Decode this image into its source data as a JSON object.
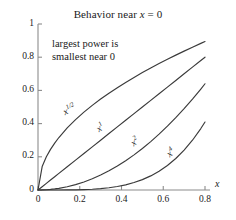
{
  "chart_data": {
    "type": "line",
    "title": "Behavior near x = 0",
    "title_prefix": "Behavior near ",
    "title_var": "x",
    "title_suffix": " = 0",
    "xlabel": "x",
    "ylabel": "",
    "xlim": [
      0,
      0.8
    ],
    "ylim": [
      0,
      1
    ],
    "grid": false,
    "legend": "none",
    "xticks": [
      "0",
      "0.2",
      "0.4",
      "0.6",
      "0.8"
    ],
    "xtick_values": [
      0,
      0.2,
      0.4,
      0.6,
      0.8
    ],
    "yticks": [
      "0",
      "0.2",
      "0.4",
      "0.6",
      "0.8",
      "1"
    ],
    "ytick_values": [
      0,
      0.2,
      0.4,
      0.6,
      0.8,
      1
    ],
    "annotations": [
      {
        "name": "largest-power-note",
        "line1": "largest power is",
        "line2": "smallest near 0"
      }
    ],
    "x": [
      0,
      0.02,
      0.04,
      0.06,
      0.08,
      0.1,
      0.14,
      0.18,
      0.22,
      0.26,
      0.3,
      0.34,
      0.38,
      0.42,
      0.46,
      0.5,
      0.54,
      0.58,
      0.62,
      0.66,
      0.7,
      0.74,
      0.78,
      0.8
    ],
    "series": [
      {
        "name": "x^(1/2)",
        "base": "x",
        "exponent": "1/2",
        "color": "#3a3a3a",
        "label_x": 0.135,
        "label_y": 0.44,
        "label_rotation": -27,
        "values": [
          0,
          0.1414,
          0.2,
          0.2449,
          0.2828,
          0.3162,
          0.3742,
          0.4243,
          0.469,
          0.5099,
          0.5477,
          0.5831,
          0.6164,
          0.6481,
          0.6782,
          0.7071,
          0.7348,
          0.7616,
          0.7874,
          0.8124,
          0.8367,
          0.8602,
          0.8832,
          0.8944
        ]
      },
      {
        "name": "x^1",
        "base": "x",
        "exponent": "1",
        "color": "#3a3a3a",
        "label_x": 0.295,
        "label_y": 0.335,
        "label_rotation": -34,
        "values": [
          0,
          0.02,
          0.04,
          0.06,
          0.08,
          0.1,
          0.14,
          0.18,
          0.22,
          0.26,
          0.3,
          0.34,
          0.38,
          0.42,
          0.46,
          0.5,
          0.54,
          0.58,
          0.62,
          0.66,
          0.7,
          0.74,
          0.78,
          0.8
        ]
      },
      {
        "name": "x^2",
        "base": "x",
        "exponent": "2",
        "color": "#3a3a3a",
        "label_x": 0.465,
        "label_y": 0.255,
        "label_rotation": -38,
        "values": [
          0,
          0.0004,
          0.0016,
          0.0036,
          0.0064,
          0.01,
          0.0196,
          0.0324,
          0.0484,
          0.0676,
          0.09,
          0.1156,
          0.1444,
          0.1764,
          0.2116,
          0.25,
          0.2916,
          0.3364,
          0.3844,
          0.4356,
          0.49,
          0.5476,
          0.6084,
          0.64
        ]
      },
      {
        "name": "x^4",
        "base": "x",
        "exponent": "4",
        "color": "#3a3a3a",
        "label_x": 0.635,
        "label_y": 0.185,
        "label_rotation": -40,
        "values": [
          0,
          2e-07,
          2.6e-06,
          1.3e-05,
          4.1e-05,
          0.0001,
          0.0004,
          0.001,
          0.0023,
          0.0046,
          0.0081,
          0.0134,
          0.0209,
          0.0311,
          0.0448,
          0.0625,
          0.085,
          0.1132,
          0.1478,
          0.1898,
          0.2401,
          0.2999,
          0.3702,
          0.4096
        ]
      }
    ]
  },
  "axes_style": {
    "axis_color": "#8c8c8c",
    "curve_color": "#3a3a3a",
    "background": "#ffffff"
  }
}
